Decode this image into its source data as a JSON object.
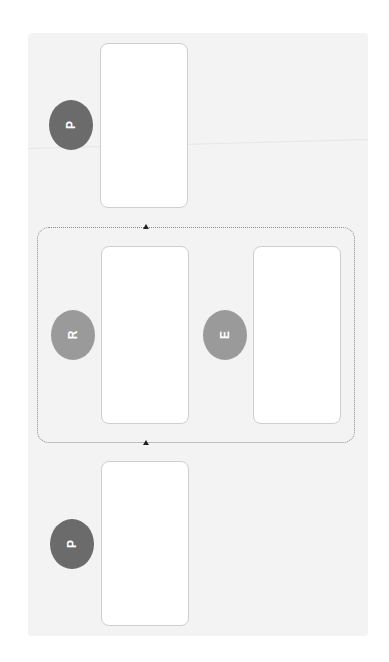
{
  "diagram": {
    "orientation": "rotated -90deg",
    "colors": {
      "background": "#ffffff",
      "panel": "#f3f3f3",
      "card_fill": "#ffffff",
      "card_border": "#cfcfcf",
      "badge_dark": "#6b6b6b",
      "badge_light": "#9a9a9a",
      "group_border": "#8a8a8a",
      "arrow": "#222222"
    },
    "nodes": [
      {
        "id": "top",
        "badge": "P",
        "badge_shade": "dark"
      },
      {
        "id": "middle-left",
        "badge": "R",
        "badge_shade": "light",
        "group": "loop"
      },
      {
        "id": "middle-right",
        "badge": "E",
        "badge_shade": "light",
        "group": "loop"
      },
      {
        "id": "bottom",
        "badge": "P",
        "badge_shade": "dark"
      }
    ],
    "group": {
      "id": "loop",
      "style": "dotted",
      "members": [
        "R",
        "E"
      ]
    },
    "connectors": [
      {
        "position": "group-top",
        "marker": "arrow-up"
      },
      {
        "position": "group-bottom",
        "marker": "arrow-up"
      }
    ]
  }
}
